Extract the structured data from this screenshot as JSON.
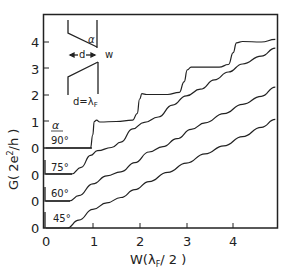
{
  "chart_data": {
    "type": "line",
    "title": "",
    "xlabel": "W(λF/2)",
    "ylabel": "G( 2e²/h )",
    "xlim": [
      0,
      5
    ],
    "ylim": [
      0,
      4.5
    ],
    "x_ticks": [
      "0",
      "1",
      "2",
      "3",
      "4"
    ],
    "y_ticks": [
      "1",
      "2",
      "3",
      "4"
    ],
    "grid": false,
    "legend_title": "α",
    "note": "Curves offset vertically; each has its own zero baseline",
    "series": [
      {
        "name": "90°",
        "offset_zero_label": "0",
        "points": [
          [
            0,
            0
          ],
          [
            0.95,
            0
          ],
          [
            1.0,
            0.5
          ],
          [
            1.03,
            1.0
          ],
          [
            1.08,
            1.05
          ],
          [
            1.15,
            0.98
          ],
          [
            1.5,
            1.0
          ],
          [
            1.85,
            1.05
          ],
          [
            1.95,
            1.3
          ],
          [
            2.0,
            1.85
          ],
          [
            2.05,
            2.05
          ],
          [
            2.15,
            2.02
          ],
          [
            2.6,
            2.02
          ],
          [
            2.85,
            2.1
          ],
          [
            2.95,
            2.5
          ],
          [
            3.02,
            2.95
          ],
          [
            3.1,
            3.05
          ],
          [
            3.7,
            3.05
          ],
          [
            3.9,
            3.15
          ],
          [
            4.0,
            3.6
          ],
          [
            4.07,
            3.97
          ],
          [
            4.2,
            4.02
          ],
          [
            4.6,
            4.0
          ],
          [
            4.9,
            4.1
          ]
        ]
      },
      {
        "name": "75°",
        "offset_zero_label": "0",
        "points": [
          [
            0,
            0
          ],
          [
            0.55,
            0
          ],
          [
            0.75,
            0.25
          ],
          [
            0.95,
            0.7
          ],
          [
            1.1,
            0.88
          ],
          [
            1.4,
            1.0
          ],
          [
            1.6,
            1.2
          ],
          [
            1.85,
            1.7
          ],
          [
            2.1,
            1.95
          ],
          [
            2.4,
            2.15
          ],
          [
            2.7,
            2.6
          ],
          [
            3.0,
            2.95
          ],
          [
            3.3,
            3.2
          ],
          [
            3.6,
            3.55
          ],
          [
            3.9,
            3.85
          ],
          [
            4.2,
            4.15
          ],
          [
            4.6,
            4.45
          ],
          [
            4.9,
            4.75
          ]
        ]
      },
      {
        "name": "60°",
        "offset_zero_label": "0",
        "points": [
          [
            0,
            0
          ],
          [
            0.5,
            0
          ],
          [
            0.7,
            0.2
          ],
          [
            1.0,
            0.65
          ],
          [
            1.3,
            0.95
          ],
          [
            1.6,
            1.1
          ],
          [
            1.9,
            1.45
          ],
          [
            2.2,
            1.85
          ],
          [
            2.5,
            2.05
          ],
          [
            2.8,
            2.35
          ],
          [
            3.1,
            2.7
          ],
          [
            3.4,
            2.95
          ],
          [
            3.8,
            3.3
          ],
          [
            4.2,
            3.65
          ],
          [
            4.6,
            3.95
          ],
          [
            4.9,
            4.3
          ]
        ]
      },
      {
        "name": "45°",
        "offset_zero_label": "0",
        "points": [
          [
            0,
            0
          ],
          [
            0.45,
            0
          ],
          [
            0.7,
            0.3
          ],
          [
            1.0,
            0.7
          ],
          [
            1.3,
            0.95
          ],
          [
            1.6,
            1.15
          ],
          [
            1.9,
            1.45
          ],
          [
            2.2,
            1.75
          ],
          [
            2.6,
            2.1
          ],
          [
            3.0,
            2.45
          ],
          [
            3.4,
            2.8
          ],
          [
            3.8,
            3.1
          ],
          [
            4.2,
            3.45
          ],
          [
            4.6,
            3.8
          ],
          [
            4.9,
            4.1
          ]
        ]
      }
    ],
    "inset": {
      "labels": [
        "α",
        "d",
        "w",
        "d=λF"
      ]
    }
  },
  "labels": {
    "alpha": "α",
    "a90": "90°",
    "a75": "75°",
    "a60": "60°",
    "a45": "45°",
    "zero": "0",
    "inset_d": "d",
    "inset_w": "w",
    "inset_eq_d": "d=λ",
    "inset_eq_sub": "F",
    "ylab_G": "G(",
    "ylab_2e": "2e",
    "ylab_sup": "2",
    "ylab_h": "/h )",
    "xlab_W": "W(λ",
    "xlab_sub": "F",
    "xlab_rest": "/ 2 )"
  }
}
